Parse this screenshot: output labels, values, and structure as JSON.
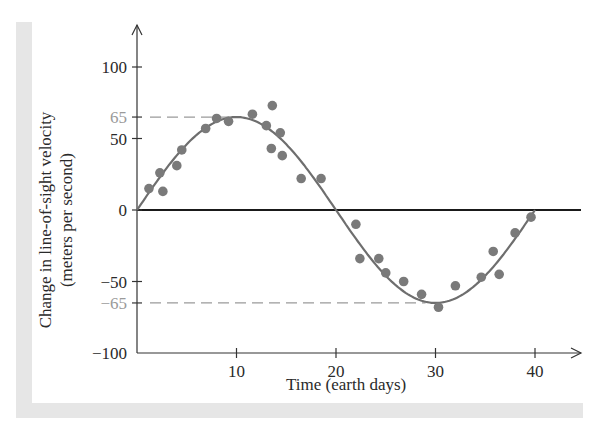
{
  "chart_data": {
    "type": "scatter",
    "title": "",
    "xlabel": "Time (earth days)",
    "ylabel": "Change in line-of-sight velocity (meters per second)",
    "ylabel_line1": "Change in line-of-sight velocity",
    "ylabel_line2": "(meters per second)",
    "xlim": [
      0,
      45
    ],
    "ylim": [
      -100,
      100
    ],
    "x_ticks": [
      10,
      20,
      30,
      40
    ],
    "x_tick_labels": [
      "10",
      "20",
      "30",
      "40"
    ],
    "y_ticks": [
      100,
      65,
      50,
      0,
      -50,
      -65,
      -100
    ],
    "y_tick_labels": [
      "100",
      "65",
      "50",
      "0",
      "−50",
      "−65",
      "−100"
    ],
    "grid": false,
    "legend": null,
    "reference_lines": [
      {
        "y": 65,
        "style": "dashed",
        "x_end": 10,
        "color": "#9a9a9a"
      },
      {
        "y": -65,
        "style": "dashed",
        "x_end": 29,
        "color": "#9a9a9a"
      },
      {
        "y": 0,
        "style": "solid",
        "x_end": 45,
        "color": "#1a1a1a"
      }
    ],
    "series": [
      {
        "name": "Observed velocity",
        "type": "scatter",
        "color": "#7a7a7a",
        "points": [
          [
            1.2,
            15
          ],
          [
            2.3,
            26
          ],
          [
            2.6,
            13
          ],
          [
            4.0,
            31
          ],
          [
            4.5,
            42
          ],
          [
            6.9,
            57
          ],
          [
            8.0,
            64
          ],
          [
            9.2,
            62
          ],
          [
            11.6,
            67
          ],
          [
            13.0,
            59
          ],
          [
            13.6,
            73
          ],
          [
            14.4,
            54
          ],
          [
            13.5,
            43
          ],
          [
            14.6,
            38
          ],
          [
            16.5,
            22
          ],
          [
            18.5,
            22
          ],
          [
            22.0,
            -10
          ],
          [
            22.4,
            -34
          ],
          [
            24.3,
            -34
          ],
          [
            25.0,
            -44
          ],
          [
            26.8,
            -50
          ],
          [
            28.6,
            -59
          ],
          [
            30.3,
            -68
          ],
          [
            32.0,
            -53
          ],
          [
            34.6,
            -47
          ],
          [
            35.8,
            -29
          ],
          [
            36.4,
            -45
          ],
          [
            38.0,
            -16
          ],
          [
            39.6,
            -5
          ]
        ]
      },
      {
        "name": "Best-fit sine curve",
        "type": "line",
        "color": "#6e6e6e",
        "amplitude": 65,
        "period": 40,
        "x_range": [
          0,
          40
        ]
      }
    ]
  }
}
